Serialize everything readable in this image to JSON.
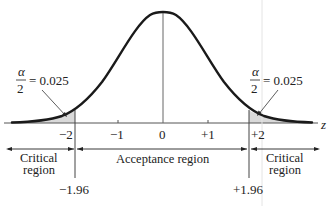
{
  "diagram": {
    "axis": {
      "variable": "z",
      "ticks": [
        "−2",
        "−1",
        "0",
        "+1",
        "+2"
      ],
      "tick_values": [
        -2,
        -1,
        0,
        1,
        2
      ]
    },
    "annotations": {
      "left_alpha": {
        "numerator": "α",
        "denominator": "2",
        "value": "= 0.025"
      },
      "right_alpha": {
        "numerator": "α",
        "denominator": "2",
        "value": "= 0.025"
      }
    },
    "regions": {
      "left": {
        "line1": "Critical",
        "line2": "region"
      },
      "middle": {
        "label": "Acceptance region"
      },
      "right": {
        "line1": "Critical",
        "line2": "region"
      }
    },
    "critical_values": {
      "lower": "−1.96",
      "upper": "+1.96"
    },
    "colors": {
      "curve": "#1a1a1a",
      "shade": "#d9d9d9",
      "axis": "#555555",
      "lines": "#444444"
    }
  }
}
